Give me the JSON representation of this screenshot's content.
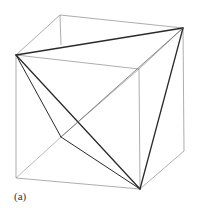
{
  "figure": {
    "caption": "(a)",
    "colors": {
      "cube_edge": "#8a8a8a",
      "hidden_edge": "#9a9a9a",
      "tetra_edge": "#2a2a2a",
      "background": "#ffffff"
    },
    "vertices": {
      "back_top_left": [
        60,
        15
      ],
      "back_top_right": [
        183,
        28
      ],
      "front_top_left": [
        16,
        55
      ],
      "front_top_right": [
        139,
        69
      ],
      "back_bottom_left": [
        61,
        137
      ],
      "back_bottom_right": [
        184,
        151
      ],
      "front_bottom_left": [
        16,
        178
      ],
      "front_bottom_right": [
        140,
        189
      ]
    }
  }
}
